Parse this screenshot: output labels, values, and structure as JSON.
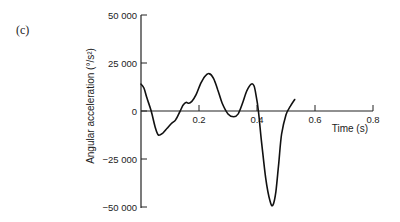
{
  "panel_label": "(c)",
  "chart_data": {
    "type": "line",
    "title": "",
    "xlabel": "Time (s)",
    "ylabel": "Angular acceleration (°/s²)",
    "xlim": [
      0,
      0.8
    ],
    "ylim": [
      -50000,
      50000
    ],
    "x_ticks": [
      "0.2",
      "0.4",
      "0.6",
      "0.8"
    ],
    "y_ticks": [
      "50 000",
      "25 000",
      "0",
      "−25 000",
      "−50 000"
    ],
    "grid": false,
    "legend": null,
    "series": [
      {
        "name": "Angular acceleration",
        "x": [
          0.0,
          0.01,
          0.02,
          0.035,
          0.05,
          0.06,
          0.075,
          0.09,
          0.105,
          0.12,
          0.135,
          0.145,
          0.155,
          0.165,
          0.175,
          0.19,
          0.205,
          0.22,
          0.235,
          0.25,
          0.265,
          0.28,
          0.3,
          0.32,
          0.335,
          0.35,
          0.365,
          0.38,
          0.39,
          0.397,
          0.405,
          0.415,
          0.43,
          0.445,
          0.455,
          0.465,
          0.475,
          0.485,
          0.5,
          0.515,
          0.53
        ],
        "values": [
          14000,
          12000,
          7000,
          0,
          -9000,
          -12500,
          -11500,
          -9000,
          -6500,
          -4500,
          0,
          3000,
          4500,
          4000,
          5000,
          8500,
          14000,
          18000,
          19500,
          17000,
          11000,
          4000,
          -1500,
          -3000,
          -1500,
          4000,
          10500,
          14000,
          13000,
          8000,
          0,
          -15000,
          -35000,
          -47000,
          -49000,
          -42000,
          -27000,
          -12000,
          -2000,
          2500,
          6000
        ]
      }
    ]
  }
}
